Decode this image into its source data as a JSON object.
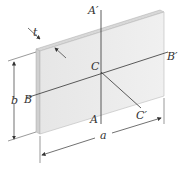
{
  "diagram": {
    "type": "rectangular thin plate with centroidal axes",
    "labels": {
      "t": "t",
      "b": "b",
      "a": "a",
      "A_top": "A′",
      "A_bottom": "A",
      "B_left": "B",
      "B_right": "B′",
      "C_center": "C",
      "C_prime": "C′"
    },
    "colors": {
      "plate_face": "#ececec",
      "plate_edge": "#c8c8c8",
      "line": "#333333"
    }
  }
}
